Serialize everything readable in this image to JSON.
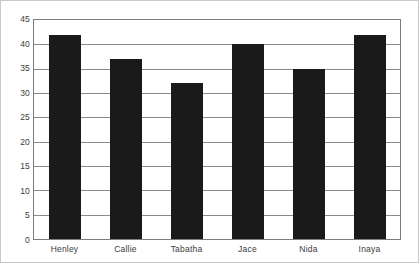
{
  "chart_data": {
    "type": "bar",
    "title": "",
    "xlabel": "",
    "ylabel": "",
    "categories": [
      "Henley",
      "Callie",
      "Tabatha",
      "Jace",
      "Nida",
      "Inaya"
    ],
    "values": [
      42,
      37,
      32,
      40,
      35,
      42
    ],
    "ylim": [
      0,
      45
    ],
    "ytick_step": 5,
    "yticks": [
      45,
      40,
      35,
      30,
      25,
      20,
      15,
      10,
      5,
      0
    ],
    "ytick_labels": [
      "45",
      "40",
      "35",
      "30",
      "25",
      "20",
      "15",
      "10",
      "5",
      "0"
    ],
    "grid": true,
    "grid_axis": "y",
    "legend": false,
    "legend_position": "none",
    "bar_color": "#1a1a1a",
    "grid_color": "#8a8a8a",
    "frame_color": "#7d7d7d",
    "background_color": "#ffffff",
    "text_color": "#3b3b3b"
  }
}
